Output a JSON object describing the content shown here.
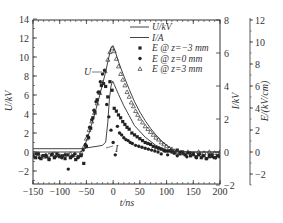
{
  "chart_data": {
    "type": "line",
    "title": "",
    "xlabel": "t/ns",
    "ylabel_left": "U/kV",
    "ylabel_right1": "I/kV",
    "ylabel_right2": "E/(kV/cm)",
    "xlim": [
      -150,
      200
    ],
    "xticks": [
      -150,
      -100,
      -50,
      0,
      50,
      100,
      150,
      200
    ],
    "ylim_left": [
      -3.3,
      14
    ],
    "yticks_left": [
      -2,
      0,
      2,
      4,
      6,
      8,
      10,
      12,
      14
    ],
    "ylim_right1": [
      -2,
      8
    ],
    "yticks_right1": [
      -2,
      0,
      2,
      4,
      6,
      8
    ],
    "ylim_right2": [
      -3,
      12
    ],
    "yticks_right2": [
      -2,
      0,
      2,
      4,
      6,
      8,
      10,
      12
    ],
    "grid": false,
    "legend_position": "upper right",
    "legend": [
      "U/kV",
      "I/A",
      "E @ z=−3 mm",
      "E @ z=0 mm",
      "E @ z=3 mm"
    ],
    "annotations": [
      {
        "text": "U",
        "x": -22,
        "y": 8.5
      },
      {
        "text": "I",
        "x": 15,
        "y": 0.4
      }
    ],
    "series": [
      {
        "name": "U/kV",
        "style": "line",
        "axis": "left",
        "x": [
          -150,
          -60,
          -55,
          -45,
          -35,
          -25,
          -15,
          -8,
          -4,
          0,
          5,
          10,
          20,
          30,
          40,
          50,
          60,
          70,
          80,
          90,
          100,
          110,
          120,
          140,
          160,
          180,
          200
        ],
        "y": [
          0,
          0,
          0.4,
          2.0,
          3.9,
          6.0,
          8.2,
          10.0,
          11.0,
          11.2,
          10.4,
          9.5,
          8.0,
          6.6,
          5.3,
          4.2,
          3.3,
          2.5,
          1.8,
          1.2,
          0.7,
          0.3,
          0.1,
          0,
          0,
          0,
          0
        ]
      },
      {
        "name": "I/A",
        "style": "line",
        "axis": "right1",
        "x": [
          -150,
          -60,
          -40,
          -20,
          -14,
          -10,
          -7,
          -4,
          -1,
          2,
          6,
          10,
          20,
          30,
          40,
          60,
          80,
          100,
          120,
          150,
          200
        ],
        "y": [
          0.2,
          0.2,
          0.3,
          0.4,
          0.6,
          1.8,
          3.2,
          4.0,
          4.3,
          4.1,
          3.8,
          3.5,
          2.8,
          2.2,
          1.6,
          0.9,
          0.4,
          0.1,
          0,
          0,
          0
        ]
      },
      {
        "name": "E @ z=−3 mm",
        "style": "square",
        "axis": "left",
        "x": [
          -150,
          -145,
          -140,
          -135,
          -130,
          -125,
          -120,
          -115,
          -110,
          -105,
          -100,
          -95,
          -90,
          -85,
          -80,
          -75,
          -70,
          -65,
          -60,
          -55,
          -50,
          -46,
          -42,
          -38,
          -34,
          -30,
          -26,
          -22,
          -18,
          -14,
          -10,
          -6,
          -2,
          2,
          6,
          10,
          14,
          18,
          22,
          26,
          30,
          35,
          40,
          45,
          50,
          55,
          60,
          65,
          70,
          75,
          80,
          85,
          90,
          95,
          100,
          105,
          110,
          115,
          120,
          125,
          130,
          135,
          140,
          145,
          150,
          155,
          160,
          165,
          170,
          175,
          180,
          185,
          190,
          195,
          200
        ],
        "y": [
          -0.3,
          -0.6,
          -0.2,
          -0.7,
          -0.4,
          -0.5,
          -0.8,
          -0.3,
          -0.6,
          -0.2,
          -0.5,
          -0.4,
          -0.7,
          -0.3,
          -0.6,
          -0.4,
          -0.8,
          -0.5,
          -0.3,
          -1.2,
          0.6,
          1.5,
          2.5,
          3.6,
          4.2,
          5.5,
          6.3,
          7.0,
          7.2,
          6.9,
          5.8,
          7.4,
          6.5,
          4.6,
          4.3,
          3.9,
          3.6,
          3.2,
          2.9,
          2.6,
          2.4,
          2.0,
          1.8,
          1.6,
          1.4,
          1.2,
          1.0,
          0.9,
          0.8,
          0.6,
          0.5,
          0.4,
          0.3,
          0.2,
          0.1,
          0.1,
          0.0,
          -0.1,
          0.2,
          -0.2,
          0.0,
          -0.3,
          -0.1,
          -0.4,
          -0.2,
          -0.5,
          -0.3,
          -0.6,
          -0.4,
          -0.7,
          -0.5,
          -0.3,
          -0.6,
          -0.4,
          -0.5
        ]
      },
      {
        "name": "E @ z=0 mm",
        "style": "circle",
        "axis": "left",
        "x": [
          -150,
          -144,
          -138,
          -132,
          -126,
          -120,
          -114,
          -108,
          -102,
          -96,
          -90,
          -84,
          -78,
          -72,
          -66,
          -60,
          -56,
          -52,
          -48,
          -44,
          -40,
          -36,
          -32,
          -28,
          -24,
          -20,
          -16,
          -12,
          -8,
          -4,
          0,
          4,
          8,
          12,
          16,
          20,
          24,
          28,
          32,
          36,
          42,
          48,
          54,
          60,
          66,
          72,
          78,
          84,
          90,
          96,
          102,
          108,
          114,
          120,
          126,
          132,
          138,
          144,
          150,
          156,
          162,
          168,
          174,
          180,
          186,
          192,
          198
        ],
        "y": [
          -0.5,
          -0.2,
          -0.6,
          -0.4,
          -0.3,
          -0.7,
          -0.2,
          -0.5,
          -0.4,
          -0.6,
          -0.3,
          -1.8,
          -0.5,
          -0.2,
          -0.6,
          -0.4,
          0.2,
          0.8,
          1.7,
          2.6,
          3.4,
          4.4,
          5.3,
          6.3,
          7.4,
          8.2,
          8.6,
          5.0,
          3.7,
          2.3,
          1.0,
          -0.3,
          2.7,
          2.0,
          1.8,
          1.5,
          1.3,
          1.2,
          1.0,
          0.9,
          0.7,
          0.6,
          0.5,
          0.4,
          0.3,
          0.2,
          0.1,
          0.0,
          -0.2,
          0.1,
          -0.3,
          0.2,
          -0.1,
          -0.4,
          0.0,
          -0.2,
          -0.5,
          -0.1,
          -0.3,
          -0.6,
          -0.2,
          -0.4,
          -0.7,
          -0.3,
          -0.5,
          -0.6,
          -0.4
        ]
      },
      {
        "name": "E @ z=3 mm",
        "style": "triangle",
        "axis": "left",
        "x": [
          -150,
          -140,
          -130,
          -120,
          -110,
          -100,
          -90,
          -80,
          -70,
          -60,
          -55,
          -50,
          -45,
          -40,
          -35,
          -30,
          -25,
          -20,
          -15,
          -10,
          -6,
          -2,
          2,
          6,
          10,
          14,
          18,
          22,
          26,
          30,
          34,
          38,
          42,
          46,
          50,
          55,
          60,
          65,
          70,
          75,
          80,
          85,
          90,
          95,
          100,
          105,
          110,
          115,
          120,
          130,
          140,
          150,
          160,
          170,
          180,
          190,
          200
        ],
        "y": [
          -0.4,
          -0.2,
          -0.5,
          -0.3,
          -0.2,
          -0.4,
          -0.3,
          -0.2,
          -0.3,
          -0.1,
          0.5,
          1.4,
          2.3,
          3.2,
          4.1,
          5.1,
          6.2,
          7.3,
          8.5,
          9.7,
          10.5,
          10.9,
          10.6,
          9.8,
          9.0,
          8.2,
          7.6,
          7.0,
          6.3,
          5.8,
          5.2,
          4.8,
          4.3,
          3.9,
          3.5,
          3.1,
          2.7,
          2.4,
          2.1,
          1.8,
          1.5,
          1.3,
          1.0,
          0.8,
          0.6,
          0.4,
          0.3,
          0.1,
          0.0,
          -0.1,
          0.0,
          -0.2,
          0.0,
          -0.1,
          0.0,
          -0.1,
          0.0
        ]
      }
    ]
  },
  "legend_labels": {
    "u": "U/kV",
    "i": "I/A",
    "e_m3": "E @ z=−3 mm",
    "e_0": "E @ z=0 mm",
    "e_3": "E @ z=3 mm"
  },
  "axis_labels": {
    "x": "t/ns",
    "left": "U/kV",
    "right1": "I/kV",
    "right2": "E/(kV/cm)"
  }
}
